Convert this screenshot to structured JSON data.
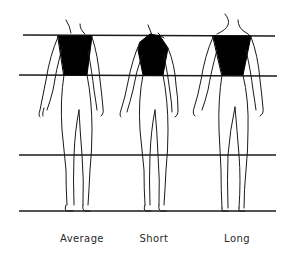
{
  "diagram": {
    "type": "figure-proportion-comparison",
    "colors": {
      "line": "#1a1a1a",
      "torso_fill": "#000000",
      "background": "#ffffff"
    },
    "guide_lines": [
      {
        "name": "shoulder-line",
        "y": 35
      },
      {
        "name": "waist-line",
        "y": 75
      },
      {
        "name": "knee-line",
        "y": 155
      },
      {
        "name": "floor-line",
        "y": 211
      }
    ],
    "figures": [
      {
        "id": "average",
        "label": "Average",
        "center_x": 77
      },
      {
        "id": "short",
        "label": "Short",
        "center_x": 154
      },
      {
        "id": "long",
        "label": "Long",
        "center_x": 232
      }
    ]
  }
}
